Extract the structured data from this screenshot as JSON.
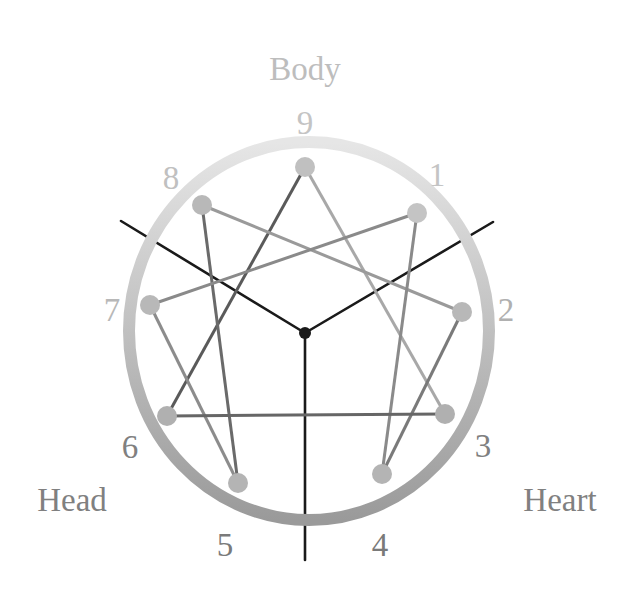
{
  "diagram": {
    "type": "enneagram",
    "centers": [
      {
        "label": "Body",
        "x": 305,
        "y": 72,
        "color": "#bdbdbd"
      },
      {
        "label": "Head",
        "x": 72,
        "y": 503,
        "color": "#808080"
      },
      {
        "label": "Heart",
        "x": 560,
        "y": 503,
        "color": "#808080"
      }
    ],
    "ring": {
      "cx": 309,
      "cy": 331,
      "rx": 180,
      "ry": 189,
      "stroke_width": 12,
      "color_top": "#e6e6e6",
      "color_bottom": "#9a9a9a"
    },
    "hub": {
      "x": 305,
      "y": 333,
      "r": 6,
      "color": "#1a1a1a"
    },
    "spokes": [
      {
        "x": 121,
        "y": 221
      },
      {
        "x": 493,
        "y": 222
      },
      {
        "x": 305,
        "y": 560
      }
    ],
    "points": [
      {
        "id": "1",
        "x": 417,
        "y": 213,
        "lx": 437,
        "ly": 178,
        "color": "#c4c4c4",
        "label_color": "#c4c4c4"
      },
      {
        "id": "2",
        "x": 462,
        "y": 312,
        "lx": 506,
        "ly": 313,
        "color": "#b8b8b8",
        "label_color": "#b0b0b0"
      },
      {
        "id": "3",
        "x": 445,
        "y": 414,
        "lx": 483,
        "ly": 449,
        "color": "#b0b0b0",
        "label_color": "#808080"
      },
      {
        "id": "4",
        "x": 382,
        "y": 474,
        "lx": 380,
        "ly": 548,
        "color": "#b4b4b4",
        "label_color": "#7a7a7a"
      },
      {
        "id": "5",
        "x": 238,
        "y": 483,
        "lx": 225,
        "ly": 548,
        "color": "#b4b4b4",
        "label_color": "#7a7a7a"
      },
      {
        "id": "6",
        "x": 167,
        "y": 416,
        "lx": 130,
        "ly": 450,
        "color": "#b0b0b0",
        "label_color": "#808080"
      },
      {
        "id": "7",
        "x": 150,
        "y": 305,
        "lx": 112,
        "ly": 313,
        "color": "#b8b8b8",
        "label_color": "#b8b8b8"
      },
      {
        "id": "8",
        "x": 202,
        "y": 205,
        "lx": 171,
        "ly": 181,
        "color": "#b8b8b8",
        "label_color": "#c0c0c0"
      },
      {
        "id": "9",
        "x": 305,
        "y": 167,
        "lx": 305,
        "ly": 126,
        "color": "#c0c0c0",
        "label_color": "#c4c4c4"
      }
    ],
    "connections": [
      {
        "from": "9",
        "to": "6",
        "color": "#5a5a5a"
      },
      {
        "from": "9",
        "to": "3",
        "color": "#a8a8a8"
      },
      {
        "from": "8",
        "to": "2",
        "color": "#9a9a9a"
      },
      {
        "from": "8",
        "to": "5",
        "color": "#6a6a6a"
      },
      {
        "from": "1",
        "to": "7",
        "color": "#8a8a8a"
      },
      {
        "from": "1",
        "to": "4",
        "color": "#8a8a8a"
      },
      {
        "from": "7",
        "to": "5",
        "color": "#8c8c8c"
      },
      {
        "from": "2",
        "to": "4",
        "color": "#7a7a7a"
      },
      {
        "from": "6",
        "to": "3",
        "color": "#666666"
      }
    ]
  }
}
